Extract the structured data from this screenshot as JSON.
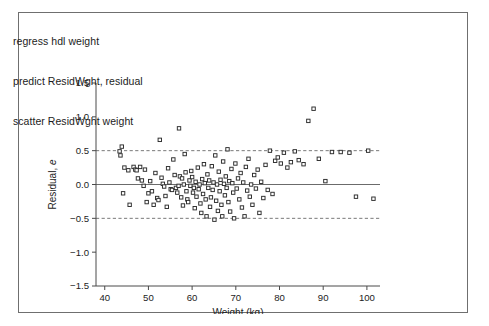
{
  "window": {
    "background_color": "#ffffff",
    "border_color": "#6f6f6f"
  },
  "code_listing": {
    "name": "stata-command-listing",
    "lines": [
      "regress hdl weight",
      "predict ResidWght, residual",
      "scatter ResidWght weight"
    ]
  },
  "chart_data": {
    "type": "scatter",
    "title": "",
    "xlabel": "Weight (kg)",
    "ylabel": "Residual, e",
    "ylabel_italic_part": "e",
    "xlim": [
      38,
      103
    ],
    "ylim": [
      -1.5,
      1.5
    ],
    "xticks": [
      40,
      50,
      60,
      70,
      80,
      90,
      100
    ],
    "xtick_labels": [
      "40",
      "50",
      "60",
      "70",
      "80",
      "90",
      "100"
    ],
    "yticks": [
      -1.5,
      -1.0,
      -0.5,
      0.0,
      0.5,
      1.0,
      1.5
    ],
    "ytick_labels": [
      "−1.5",
      "−1.0",
      "−0.5",
      "0.0",
      "0.5",
      "1.0",
      "1.5"
    ],
    "grid": false,
    "legend": "none",
    "marker": {
      "shape": "square",
      "size": 4,
      "fill": "#ffffff",
      "edge_color": "#2b2b2b"
    },
    "reference_lines": [
      {
        "name": "zero-residual-line",
        "y": 0.0,
        "style": "solid",
        "color": "#5a5a5a"
      },
      {
        "name": "upper-bound-line",
        "y": 0.5,
        "style": "dashed",
        "color": "#6a6a6a"
      },
      {
        "name": "lower-bound-line",
        "y": -0.5,
        "style": "dashed",
        "color": "#6a6a6a"
      }
    ],
    "series": [
      {
        "name": "ResidWght vs weight",
        "points": [
          [
            43.4,
            0.49
          ],
          [
            43.6,
            0.43
          ],
          [
            43.9,
            0.56
          ],
          [
            44.2,
            -0.13
          ],
          [
            44.5,
            0.25
          ],
          [
            45.4,
            0.21
          ],
          [
            45.7,
            -0.3
          ],
          [
            46.6,
            0.26
          ],
          [
            47.0,
            0.22
          ],
          [
            47.3,
            0.21
          ],
          [
            47.6,
            0.09
          ],
          [
            48.1,
            0.26
          ],
          [
            48.5,
            0.06
          ],
          [
            48.9,
            -0.02
          ],
          [
            49.2,
            0.22
          ],
          [
            49.6,
            -0.26
          ],
          [
            50.0,
            -0.13
          ],
          [
            50.4,
            0.05
          ],
          [
            50.8,
            -0.1
          ],
          [
            51.2,
            -0.3
          ],
          [
            51.6,
            0.17
          ],
          [
            52.0,
            -0.2
          ],
          [
            52.3,
            -0.23
          ],
          [
            52.6,
            0.66
          ],
          [
            53.0,
            0.1
          ],
          [
            53.3,
            0.01
          ],
          [
            53.6,
            -0.03
          ],
          [
            53.9,
            -0.17
          ],
          [
            54.2,
            -0.33
          ],
          [
            54.5,
            0.24
          ],
          [
            54.8,
            0.03
          ],
          [
            55.1,
            -0.07
          ],
          [
            55.4,
            -0.08
          ],
          [
            55.7,
            0.37
          ],
          [
            56.0,
            0.14
          ],
          [
            56.3,
            -0.05
          ],
          [
            56.6,
            -0.12
          ],
          [
            56.9,
            -0.02
          ],
          [
            57.0,
            0.83
          ],
          [
            57.2,
            0.12
          ],
          [
            57.5,
            -0.19
          ],
          [
            57.7,
            0.09
          ],
          [
            57.9,
            -0.31
          ],
          [
            58.1,
            0.0
          ],
          [
            58.3,
            0.45
          ],
          [
            58.5,
            0.18
          ],
          [
            58.7,
            -0.1
          ],
          [
            58.9,
            -0.22
          ],
          [
            59.1,
            -0.26
          ],
          [
            59.4,
            0.06
          ],
          [
            59.6,
            -0.02
          ],
          [
            59.8,
            0.2
          ],
          [
            60.0,
            0.11
          ],
          [
            60.2,
            -0.12
          ],
          [
            60.4,
            -0.05
          ],
          [
            60.6,
            -0.35
          ],
          [
            60.8,
            0.04
          ],
          [
            61.0,
            -0.18
          ],
          [
            61.3,
            0.25
          ],
          [
            61.5,
            -0.07
          ],
          [
            61.7,
            0.0
          ],
          [
            61.9,
            -0.28
          ],
          [
            62.1,
            -0.42
          ],
          [
            62.3,
            0.08
          ],
          [
            62.5,
            -0.14
          ],
          [
            62.7,
            0.3
          ],
          [
            62.9,
            0.02
          ],
          [
            63.1,
            -0.22
          ],
          [
            63.3,
            -0.47
          ],
          [
            63.5,
            0.15
          ],
          [
            63.7,
            -0.05
          ],
          [
            63.9,
            0.06
          ],
          [
            64.1,
            -0.33
          ],
          [
            64.3,
            -0.19
          ],
          [
            64.5,
            0.27
          ],
          [
            64.7,
            -0.08
          ],
          [
            64.9,
            0.03
          ],
          [
            65.1,
            -0.52
          ],
          [
            65.3,
            0.43
          ],
          [
            65.5,
            -0.24
          ],
          [
            65.7,
            0.0
          ],
          [
            65.9,
            -0.39
          ],
          [
            66.1,
            0.19
          ],
          [
            66.3,
            -0.1
          ],
          [
            66.5,
            0.07
          ],
          [
            66.7,
            -0.3
          ],
          [
            66.9,
            -0.47
          ],
          [
            67.1,
            0.34
          ],
          [
            67.3,
            0.01
          ],
          [
            67.5,
            -0.16
          ],
          [
            67.7,
            0.12
          ],
          [
            67.9,
            -0.05
          ],
          [
            68.1,
            0.52
          ],
          [
            68.3,
            -0.26
          ],
          [
            68.5,
            0.05
          ],
          [
            68.7,
            -0.4
          ],
          [
            69.0,
            0.23
          ],
          [
            69.2,
            0.02
          ],
          [
            69.4,
            -0.12
          ],
          [
            69.6,
            -0.5
          ],
          [
            69.9,
            0.31
          ],
          [
            70.2,
            -0.06
          ],
          [
            70.5,
            0.09
          ],
          [
            70.8,
            -0.22
          ],
          [
            71.1,
            0.17
          ],
          [
            71.4,
            -0.34
          ],
          [
            71.7,
            0.03
          ],
          [
            72.0,
            -0.47
          ],
          [
            72.3,
            0.26
          ],
          [
            72.6,
            -0.09
          ],
          [
            72.9,
            0.38
          ],
          [
            73.2,
            -0.18
          ],
          [
            73.5,
            0.0
          ],
          [
            73.8,
            -0.3
          ],
          [
            74.2,
            0.14
          ],
          [
            74.6,
            -0.06
          ],
          [
            75.0,
            0.22
          ],
          [
            75.4,
            -0.42
          ],
          [
            75.8,
            0.04
          ],
          [
            76.3,
            -0.2
          ],
          [
            76.8,
            0.29
          ],
          [
            77.3,
            -0.08
          ],
          [
            77.8,
            0.5
          ],
          [
            78.4,
            -0.14
          ],
          [
            79.0,
            0.35
          ],
          [
            79.6,
            0.4
          ],
          [
            80.3,
            0.31
          ],
          [
            81.0,
            0.47
          ],
          [
            81.8,
            0.25
          ],
          [
            82.6,
            0.33
          ],
          [
            83.5,
            0.49
          ],
          [
            84.4,
            0.36
          ],
          [
            85.5,
            0.3
          ],
          [
            86.6,
            0.94
          ],
          [
            87.8,
            1.12
          ],
          [
            89.0,
            0.38
          ],
          [
            90.5,
            0.05
          ],
          [
            92.0,
            0.48
          ],
          [
            94.0,
            0.48
          ],
          [
            96.0,
            0.47
          ],
          [
            97.5,
            -0.18
          ],
          [
            100.3,
            0.5
          ],
          [
            101.5,
            -0.21
          ]
        ]
      }
    ]
  }
}
